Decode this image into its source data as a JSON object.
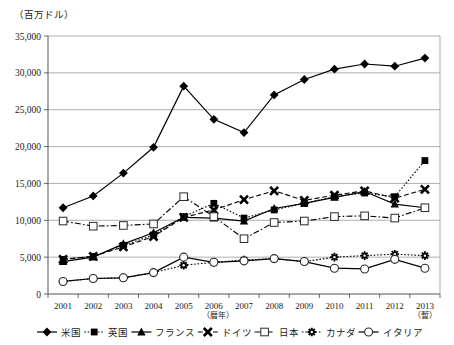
{
  "chart_data": {
    "type": "line",
    "title": "",
    "unit_label": "（百万ドル）",
    "xlabel": "（暦年）",
    "ylabel": "",
    "x_note": "（暫）",
    "x_note_year": "2013",
    "grid": true,
    "legend_position": "bottom",
    "categories": [
      "2001",
      "2002",
      "2003",
      "2004",
      "2005",
      "2006",
      "2007",
      "2008",
      "2009",
      "2010",
      "2011",
      "2012",
      "2013"
    ],
    "ylim": [
      0,
      35000
    ],
    "yticks": [
      "0",
      "5,000",
      "10,000",
      "15,000",
      "20,000",
      "25,000",
      "30,000",
      "35,000"
    ],
    "ytick_values": [
      0,
      5000,
      10000,
      15000,
      20000,
      25000,
      30000,
      35000
    ],
    "series": [
      {
        "name": "米国",
        "marker": "diamond-filled",
        "dash": "solid",
        "color": "#000000",
        "values": [
          11700,
          13300,
          16400,
          19900,
          28200,
          23700,
          21900,
          27000,
          29100,
          30500,
          31200,
          30900,
          32000
        ]
      },
      {
        "name": "英国",
        "marker": "square-filled",
        "dash": "dotted",
        "color": "#000000",
        "values": [
          4700,
          5100,
          6600,
          8000,
          10500,
          12300,
          10300,
          11400,
          12300,
          13200,
          13700,
          13200,
          18100
        ]
      },
      {
        "name": "フランス",
        "marker": "triangle-filled",
        "dash": "solid",
        "color": "#000000",
        "values": [
          4400,
          5000,
          6800,
          8300,
          10400,
          10300,
          9900,
          11600,
          12300,
          13100,
          13900,
          12200,
          11700
        ]
      },
      {
        "name": "ドイツ",
        "marker": "x-filled",
        "dash": "dashed",
        "color": "#000000",
        "values": [
          4700,
          5100,
          6400,
          7800,
          10400,
          11400,
          12800,
          14000,
          12700,
          13400,
          14000,
          13000,
          14200
        ]
      },
      {
        "name": "日本",
        "marker": "square-open",
        "dash": "dashdot",
        "color": "#000000",
        "values": [
          9900,
          9200,
          9300,
          9500,
          13200,
          10500,
          7500,
          9700,
          9900,
          10500,
          10600,
          10300,
          11700
        ]
      },
      {
        "name": "カナダ",
        "marker": "cross-snowflake",
        "dash": "dotted",
        "color": "#000000",
        "values": [
          1700,
          2100,
          2200,
          2900,
          3900,
          4300,
          4600,
          4800,
          4400,
          5000,
          5200,
          5400,
          5200
        ]
      },
      {
        "name": "イタリア",
        "marker": "circle-open",
        "dash": "solid",
        "color": "#000000",
        "values": [
          1700,
          2100,
          2200,
          2900,
          5000,
          4300,
          4500,
          4800,
          4400,
          3500,
          3400,
          4700,
          3500
        ]
      }
    ]
  }
}
